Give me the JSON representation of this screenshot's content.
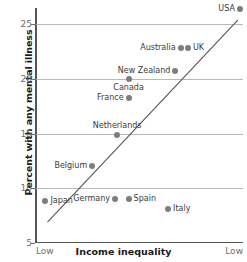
{
  "chart_data": {
    "type": "scatter",
    "title": "",
    "xlabel": "Income inequality",
    "ylabel": "Percent with any mental illness",
    "xlim_labels": [
      "Low",
      "Low"
    ],
    "ylim": [
      5,
      26.5
    ],
    "y_ticks": [
      25,
      20,
      15,
      10,
      5
    ],
    "grid": "horizontal",
    "legend": "none",
    "points": [
      {
        "name": "USA",
        "x": 0.985,
        "y": 26.4,
        "label_pos": "left"
      },
      {
        "name": "Australia",
        "x": 0.7,
        "y": 22.8,
        "label_pos": "left"
      },
      {
        "name": "UK",
        "x": 0.735,
        "y": 22.8,
        "label_pos": "right"
      },
      {
        "name": "New Zealand",
        "x": 0.675,
        "y": 20.7,
        "label_pos": "left"
      },
      {
        "name": "Canada",
        "x": 0.45,
        "y": 20.0,
        "label_pos": "below"
      },
      {
        "name": "France",
        "x": 0.45,
        "y": 18.3,
        "label_pos": "left"
      },
      {
        "name": "Netherlands",
        "x": 0.395,
        "y": 14.9,
        "label_pos": "above"
      },
      {
        "name": "Belgium",
        "x": 0.275,
        "y": 12.0,
        "label_pos": "left"
      },
      {
        "name": "Japan",
        "x": 0.05,
        "y": 8.8,
        "label_pos": "right"
      },
      {
        "name": "Germany",
        "x": 0.385,
        "y": 9.0,
        "label_pos": "left"
      },
      {
        "name": "Spain",
        "x": 0.45,
        "y": 9.0,
        "label_pos": "right"
      },
      {
        "name": "Italy",
        "x": 0.64,
        "y": 8.1,
        "label_pos": "right"
      }
    ],
    "trendline": {
      "x_start": 0.06,
      "y_start": 6.9,
      "x_end": 0.975,
      "y_end": 25.4
    }
  },
  "axes": {
    "y_title": "Percent with any mental illness",
    "x_title": "Income inequality",
    "x_left_label": "Low",
    "x_right_label": "Low",
    "y_tick_labels": [
      "25",
      "20",
      "15",
      "10",
      "5"
    ]
  },
  "colors": {
    "point": "#7d7d7d",
    "gridline": "#b9b9b9",
    "axis": "#555555",
    "label_text": "#3a3a3a",
    "tick_text": "#6e6e6e",
    "title_text": "#1a1a1a",
    "background": "#ffffff"
  }
}
